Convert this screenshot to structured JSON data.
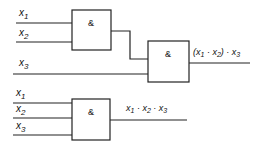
{
  "diagram": {
    "gate_symbol": "&",
    "top_circuit": {
      "inputs": [
        {
          "name": "x",
          "sub": "1"
        },
        {
          "name": "x",
          "sub": "2"
        },
        {
          "name": "x",
          "sub": "3"
        }
      ],
      "gate1_label": "&",
      "gate2_label": "&",
      "output_label": {
        "open": "(x",
        "s1": "1",
        "dot1": " · x",
        "s2": "2",
        "close": ") · x",
        "s3": "3"
      }
    },
    "bottom_circuit": {
      "inputs": [
        {
          "name": "x",
          "sub": "1"
        },
        {
          "name": "x",
          "sub": "2"
        },
        {
          "name": "x",
          "sub": "3"
        }
      ],
      "gate_label": "&",
      "output_label": {
        "a": "x",
        "s1": "1",
        "b": " · x",
        "s2": "2",
        "c": " · x",
        "s3": "3"
      }
    }
  }
}
